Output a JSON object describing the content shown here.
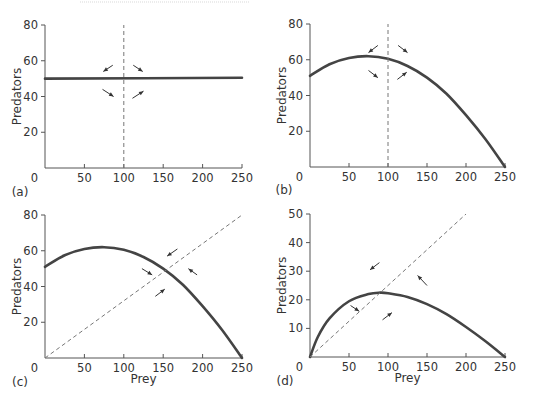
{
  "figure": {
    "top_rule": true
  },
  "chart_data": [
    {
      "panel": "(a)",
      "type": "line",
      "xlabel": "",
      "ylabel": "Predators",
      "xlim": [
        0,
        250
      ],
      "ylim": [
        0,
        80
      ],
      "xticks": [
        0,
        50,
        100,
        150,
        200,
        250
      ],
      "yticks": [
        20,
        40,
        60,
        80
      ],
      "grid": false,
      "series": [
        {
          "name": "predator isocline",
          "style": "solid",
          "x": [
            0,
            250
          ],
          "y": [
            50,
            50.5
          ]
        },
        {
          "name": "prey isocline",
          "style": "dashed",
          "x": [
            100,
            100
          ],
          "y": [
            0,
            80
          ]
        }
      ],
      "arrows": [
        {
          "from": [
            86,
            57.5
          ],
          "to": [
            74,
            54
          ],
          "note": "upper-left: pointing left-down"
        },
        {
          "from": [
            112,
            57.5
          ],
          "to": [
            124,
            54
          ],
          "note": "upper-right: pointing left-up (arrowhead at upper-left)"
        },
        {
          "from": [
            73,
            44
          ],
          "to": [
            87,
            40
          ],
          "note": "lower-left: pointing right-down"
        },
        {
          "from": [
            111,
            39
          ],
          "to": [
            125,
            43
          ],
          "note": "lower-right: pointing right-up"
        }
      ]
    },
    {
      "panel": "(b)",
      "type": "line",
      "xlabel": "",
      "ylabel": "Predators",
      "xlim": [
        0,
        250
      ],
      "ylim": [
        0,
        80
      ],
      "xticks": [
        0,
        50,
        100,
        150,
        200,
        250
      ],
      "yticks": [
        20,
        40,
        60,
        80
      ],
      "grid": false,
      "series": [
        {
          "name": "prey isocline (humped)",
          "style": "solid",
          "x": [
            0,
            25,
            50,
            75,
            100,
            125,
            150,
            175,
            200,
            225,
            250
          ],
          "y": [
            51,
            57.5,
            61,
            62,
            60.5,
            56.5,
            50,
            41,
            29,
            15.5,
            0
          ]
        },
        {
          "name": "predator isocline",
          "style": "dashed",
          "x": [
            100,
            100
          ],
          "y": [
            0,
            80
          ]
        }
      ],
      "arrows": [
        {
          "from": [
            87,
            68
          ],
          "to": [
            75,
            64
          ]
        },
        {
          "from": [
            113,
            68
          ],
          "to": [
            125,
            64
          ]
        },
        {
          "from": [
            75,
            54
          ],
          "to": [
            87,
            50
          ]
        },
        {
          "from": [
            112,
            49
          ],
          "to": [
            124,
            53
          ]
        }
      ]
    },
    {
      "panel": "(c)",
      "type": "line",
      "xlabel": "Prey",
      "ylabel": "Predators",
      "xlim": [
        0,
        250
      ],
      "ylim": [
        0,
        80
      ],
      "xticks": [
        0,
        50,
        100,
        150,
        200,
        250
      ],
      "yticks": [
        20,
        40,
        60,
        80
      ],
      "grid": false,
      "series": [
        {
          "name": "prey isocline (humped)",
          "style": "solid",
          "x": [
            0,
            25,
            50,
            75,
            100,
            125,
            150,
            175,
            200,
            225,
            250
          ],
          "y": [
            51,
            57.5,
            61,
            62,
            60.5,
            56.5,
            50,
            41,
            29,
            15.5,
            0
          ]
        },
        {
          "name": "predator isocline (ratio-dependent)",
          "style": "dashed",
          "x": [
            0,
            250
          ],
          "y": [
            0,
            80
          ]
        }
      ],
      "arrows": [
        {
          "from": [
            168,
            61
          ],
          "to": [
            155,
            57
          ]
        },
        {
          "from": [
            123,
            50
          ],
          "to": [
            136,
            46.5
          ]
        },
        {
          "from": [
            193,
            46.5
          ],
          "to": [
            182,
            50
          ]
        },
        {
          "from": [
            140,
            34.5
          ],
          "to": [
            152,
            38.5
          ]
        }
      ]
    },
    {
      "panel": "(d)",
      "type": "line",
      "xlabel": "Prey",
      "ylabel": "Predators",
      "xlim": [
        0,
        250
      ],
      "ylim": [
        0,
        50
      ],
      "xticks": [
        0,
        50,
        100,
        150,
        200,
        250
      ],
      "yticks": [
        10,
        20,
        30,
        40,
        50
      ],
      "grid": false,
      "series": [
        {
          "name": "prey isocline (humped from origin)",
          "style": "solid",
          "x": [
            0,
            10,
            25,
            50,
            75,
            90,
            100,
            125,
            150,
            175,
            200,
            225,
            250
          ],
          "y": [
            0,
            7,
            13.5,
            19.5,
            22,
            22.5,
            22.3,
            21,
            18.5,
            15,
            10.5,
            5.5,
            0
          ]
        },
        {
          "name": "predator isocline (ratio-dependent)",
          "style": "dashed",
          "x": [
            0,
            200
          ],
          "y": [
            0,
            50
          ]
        }
      ],
      "arrows": [
        {
          "from": [
            89,
            33
          ],
          "to": [
            77,
            30.5
          ]
        },
        {
          "from": [
            150,
            25
          ],
          "to": [
            138,
            28.5
          ]
        },
        {
          "from": [
            52,
            18
          ],
          "to": [
            63,
            16
          ]
        },
        {
          "from": [
            93,
            13
          ],
          "to": [
            105,
            15.5
          ]
        }
      ]
    }
  ]
}
